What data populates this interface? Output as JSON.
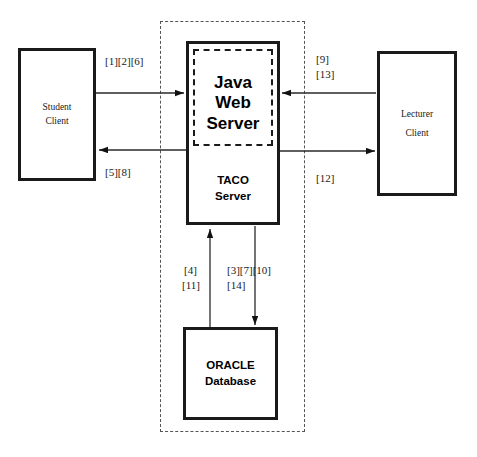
{
  "diagram": {
    "boundary_label": "system-boundary"
  },
  "nodes": {
    "student_client": {
      "line1": "Student",
      "line2": "Client"
    },
    "lecturer_client": {
      "line1": "Lecturer",
      "line2": "Client"
    },
    "java_web_server": {
      "line1": "Java",
      "line2": "Web",
      "line3": "Server"
    },
    "taco_server": {
      "line1": "TACO",
      "line2": "Server"
    },
    "oracle_database": {
      "line1": "ORACLE",
      "line2": "Database"
    }
  },
  "flows": {
    "student_to_server": "[1][2][6]",
    "server_to_student": "[5][8]",
    "lecturer_to_server_line1": "[9]",
    "lecturer_to_server_line2": "[13]",
    "server_to_lecturer": "[12]",
    "db_to_server_line1": "[4]",
    "db_to_server_line2": "[11]",
    "server_to_db_line1": "[3][7][10]",
    "server_to_db_line2": "[14]"
  },
  "colors": {
    "stroke": "#1a1a1a",
    "boundary": "#555555",
    "background": "#ffffff"
  }
}
